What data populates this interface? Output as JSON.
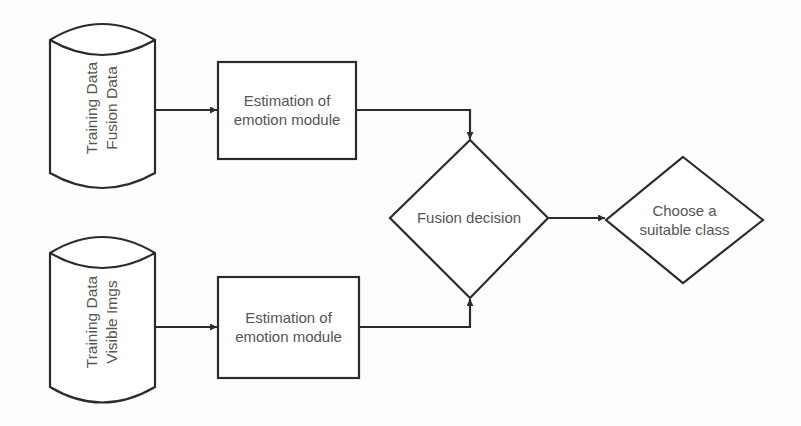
{
  "diagram": {
    "type": "flowchart",
    "colors": {
      "stroke": "#2b2b2b",
      "text": "#555555",
      "background": "#fdfdfc"
    },
    "nodes": [
      {
        "id": "db1",
        "shape": "cylinder",
        "line1": "Training Data",
        "line2": "Fusion Data"
      },
      {
        "id": "db2",
        "shape": "cylinder",
        "line1": "Training Data",
        "line2": "Visible Imgs"
      },
      {
        "id": "est1",
        "shape": "rectangle",
        "line1": "Estimation of",
        "line2": "emotion module"
      },
      {
        "id": "est2",
        "shape": "rectangle",
        "line1": "Estimation of",
        "line2": "emotion module"
      },
      {
        "id": "fusion",
        "shape": "diamond",
        "label": "Fusion decision"
      },
      {
        "id": "choose",
        "shape": "diamond",
        "line1": "Choose a",
        "line2": "suitable class"
      }
    ],
    "edges": [
      {
        "from": "db1",
        "to": "est1"
      },
      {
        "from": "db2",
        "to": "est2"
      },
      {
        "from": "est1",
        "to": "fusion"
      },
      {
        "from": "est2",
        "to": "fusion"
      },
      {
        "from": "fusion",
        "to": "choose"
      }
    ]
  }
}
